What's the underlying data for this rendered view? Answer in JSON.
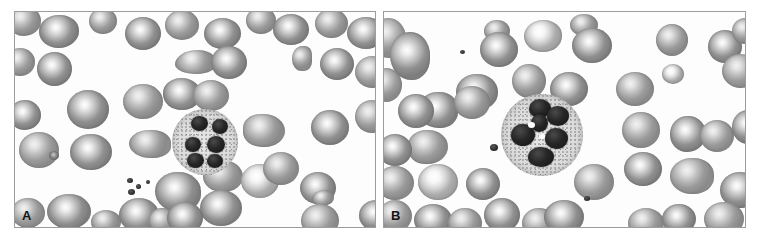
{
  "figure": {
    "type": "micrograph-figure",
    "modality": "peripheral blood smear, light microscopy",
    "rendering": "grayscale",
    "background_color": "#ffffff",
    "panel_border_color": "#9c9c9c",
    "panel_count": 2
  },
  "panels": [
    {
      "label": "A",
      "name": "panel-a",
      "content": "peripheral blood smear with a single hypersegmented neutrophil surrounded by red blood cells and a small platelet cluster",
      "white_cell": {
        "name": "hypersegmented-neutrophil",
        "nuclear_lobes": 6,
        "cytoplasm": "pale granular",
        "relative_size": "small"
      },
      "red_blood_cells": {
        "appearance": "biconcave discs with central pallor",
        "tone": "#909090"
      },
      "platelets": {
        "count": 4,
        "location": "lower left of centre",
        "tone": "#1f1f1f"
      }
    },
    {
      "label": "B",
      "name": "panel-b",
      "content": "peripheral blood smear with a large hypersegmented neutrophil surrounded by red blood cells",
      "white_cell": {
        "name": "hypersegmented-neutrophil",
        "nuclear_lobes": 6,
        "cytoplasm": "abundant granular with small vacuoles",
        "relative_size": "large"
      },
      "red_blood_cells": {
        "appearance": "biconcave discs with central pallor",
        "tone": "#8b8b8b"
      },
      "platelets": {
        "count": 2,
        "location": "left of centre and lower centre",
        "tone": "#1f1f1f"
      }
    }
  ],
  "colors": {
    "background": "#ffffff",
    "panel_border": "#9c9c9c",
    "rbc_mid": "#909090",
    "rbc_dark": "#767676",
    "rbc_pallor": "#f4f4f4",
    "nucleus": "#1b1b1b",
    "cytoplasm": "#dcdcdc",
    "label_text": "#141414"
  }
}
